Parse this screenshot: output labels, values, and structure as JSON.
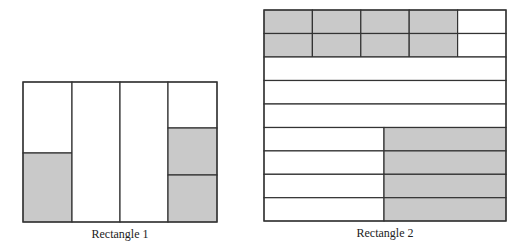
{
  "colors": {
    "shaded": "#c9c9c9",
    "unshaded": "#ffffff",
    "stroke": "#333333"
  },
  "rectangle_1": {
    "caption": "Rectangle 1",
    "columns": 4,
    "parts": [
      {
        "column": 1,
        "division": "halves",
        "shaded": 1,
        "shaded_position": "bottom"
      },
      {
        "column": 2,
        "division": "whole",
        "shaded": 0
      },
      {
        "column": 3,
        "division": "whole",
        "shaded": 0
      },
      {
        "column": 4,
        "division": "thirds",
        "shaded": 2,
        "shaded_position": "bottom"
      }
    ]
  },
  "rectangle_2": {
    "caption": "Rectangle 2",
    "rows": 9,
    "parts": [
      {
        "rows": [
          1,
          2
        ],
        "division": "fifths",
        "shaded": 4,
        "shaded_position": "left"
      },
      {
        "rows": [
          3,
          4,
          5
        ],
        "division": "whole",
        "shaded": 0
      },
      {
        "rows": [
          6,
          7,
          8,
          9
        ],
        "division": "halves",
        "shaded": 1,
        "shaded_position": "right"
      }
    ]
  }
}
